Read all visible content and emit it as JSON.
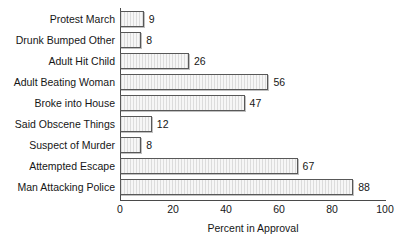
{
  "chart_data": {
    "type": "bar",
    "orientation": "horizontal",
    "title": "",
    "xlabel": "Percent in Approval",
    "ylabel": "",
    "xlim": [
      0,
      100
    ],
    "xticks": [
      0,
      20,
      40,
      60,
      80,
      100
    ],
    "grid": false,
    "legend": null,
    "show_value_labels": true,
    "categories": [
      "Protest March",
      "Drunk Bumped Other",
      "Adult Hit Child",
      "Adult Beating Woman",
      "Broke into House",
      "Said Obscene Things",
      "Suspect of Murder",
      "Attempted Escape",
      "Man Attacking Police"
    ],
    "values": [
      9,
      8,
      26,
      56,
      47,
      12,
      8,
      67,
      88
    ],
    "value_labels": [
      "9",
      "8",
      "26",
      "56",
      "47",
      "12",
      "8",
      "67",
      "88"
    ],
    "xtick_labels": [
      "0",
      "20",
      "40",
      "60",
      "80",
      "100"
    ],
    "colors": {
      "bar_fill": "#f2f2f2",
      "bar_hatch": "#dcdcdc",
      "bar_edge": "#585858",
      "axis": "#4a4a4a",
      "text": "#161616",
      "background": "#ffffff"
    }
  }
}
